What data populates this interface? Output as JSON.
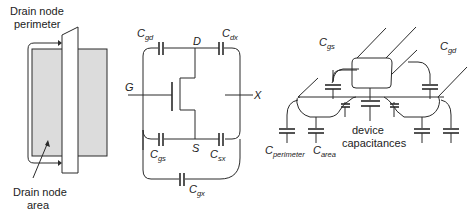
{
  "panels": {
    "layout": {
      "label_perimeter_line1": "Drain node",
      "label_perimeter_line2": "perimeter",
      "label_area_line1": "Drain node",
      "label_area_line2": "area",
      "colors": {
        "drain_fill": "#dcdcdc",
        "stroke": "#2a2a2a"
      }
    },
    "schematic": {
      "nodes": {
        "drain": "D",
        "gate": "G",
        "source": "S",
        "other": "X"
      },
      "capacitors": [
        {
          "main": "C",
          "sub": "gd"
        },
        {
          "main": "C",
          "sub": "dx"
        },
        {
          "main": "C",
          "sub": "gs"
        },
        {
          "main": "C",
          "sub": "sx"
        },
        {
          "main": "C",
          "sub": "gx"
        }
      ]
    },
    "cross_section": {
      "capacitors": [
        {
          "main": "C",
          "sub": "gs"
        },
        {
          "main": "C",
          "sub": "gd"
        },
        {
          "main": "C",
          "sub": "perimeter"
        },
        {
          "main": "C",
          "sub": "area"
        }
      ],
      "device_label_line1": "device",
      "device_label_line2": "capacitances"
    }
  }
}
